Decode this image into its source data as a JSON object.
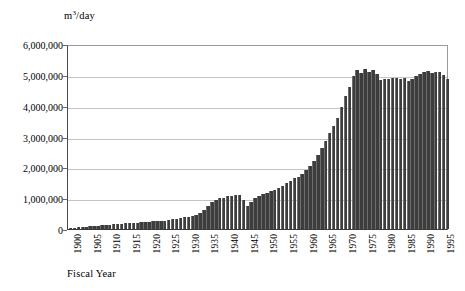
{
  "chart_data": {
    "type": "bar",
    "title": "",
    "subtitle": "",
    "unit_label": "m3/day",
    "unit_label_base": "m",
    "unit_label_sup": "3",
    "unit_label_tail": "/day",
    "xlabel": "Fiscal Year",
    "ylabel": "",
    "ylim": [
      0,
      6000000
    ],
    "ytick_step": 1000000,
    "grid": "horizontal",
    "legend": "none",
    "bar_color": "#3d3d3d",
    "gridline_color": "#c4c4c4",
    "axis_color": "#3a3a3a",
    "ytick_labels": [
      "6,000,000",
      "5,000,000",
      "4,000,000",
      "3,000,000",
      "2,000,000",
      "1,000,000",
      "0"
    ],
    "ytick_values": [
      6000000,
      5000000,
      4000000,
      3000000,
      2000000,
      1000000,
      0
    ],
    "xtick_labels": [
      "1900",
      "1905",
      "1910",
      "1915",
      "1920",
      "1925",
      "1930",
      "1935",
      "1940",
      "1945",
      "1950",
      "1955",
      "1960",
      "1965",
      "1970",
      "1975",
      "1980",
      "1985",
      "1990",
      "1995"
    ],
    "xtick_values": [
      1900,
      1905,
      1910,
      1915,
      1920,
      1925,
      1930,
      1935,
      1940,
      1945,
      1950,
      1955,
      1960,
      1965,
      1970,
      1975,
      1980,
      1985,
      1990,
      1995
    ],
    "xlim": [
      1899.5,
      1996.5
    ],
    "categories": [
      1900,
      1901,
      1902,
      1903,
      1904,
      1905,
      1906,
      1907,
      1908,
      1909,
      1910,
      1911,
      1912,
      1913,
      1914,
      1915,
      1916,
      1917,
      1918,
      1919,
      1920,
      1921,
      1922,
      1923,
      1924,
      1925,
      1926,
      1927,
      1928,
      1929,
      1930,
      1931,
      1932,
      1933,
      1934,
      1935,
      1936,
      1937,
      1938,
      1939,
      1940,
      1941,
      1942,
      1943,
      1944,
      1945,
      1946,
      1947,
      1948,
      1949,
      1950,
      1951,
      1952,
      1953,
      1954,
      1955,
      1956,
      1957,
      1958,
      1959,
      1960,
      1961,
      1962,
      1963,
      1964,
      1965,
      1966,
      1967,
      1968,
      1969,
      1970,
      1971,
      1972,
      1973,
      1974,
      1975,
      1976,
      1977,
      1978,
      1979,
      1980,
      1981,
      1982,
      1983,
      1984,
      1985,
      1986,
      1987,
      1988,
      1989,
      1990,
      1991,
      1992,
      1993,
      1994,
      1995,
      1996
    ],
    "values": [
      30000,
      45000,
      55000,
      65000,
      75000,
      85000,
      95000,
      110000,
      120000,
      130000,
      140000,
      150000,
      160000,
      170000,
      180000,
      185000,
      195000,
      205000,
      215000,
      225000,
      235000,
      245000,
      255000,
      250000,
      275000,
      290000,
      310000,
      330000,
      355000,
      380000,
      400000,
      420000,
      450000,
      520000,
      620000,
      760000,
      860000,
      930000,
      1000000,
      1020000,
      1060000,
      1080000,
      1100000,
      1090000,
      950000,
      760000,
      880000,
      1000000,
      1080000,
      1120000,
      1180000,
      1230000,
      1280000,
      1340000,
      1400000,
      1480000,
      1560000,
      1640000,
      1700000,
      1780000,
      1900000,
      2050000,
      2220000,
      2400000,
      2620000,
      2850000,
      3100000,
      3350000,
      3600000,
      3950000,
      4300000,
      4620000,
      4950000,
      5150000,
      5050000,
      5200000,
      5080000,
      5170000,
      5020000,
      4820000,
      4880000,
      4860000,
      4900000,
      4900000,
      4850000,
      4900000,
      4800000,
      4870000,
      4950000,
      5020000,
      5080000,
      5120000,
      5050000,
      5080000,
      5100000,
      4980000,
      4870000
    ]
  }
}
